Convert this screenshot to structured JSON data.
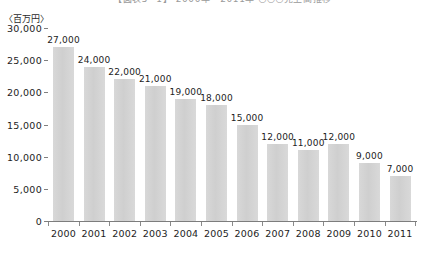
{
  "title_strip": {
    "text": "【図表5−1】 2000年〜2011年 ○○○売上高推移"
  },
  "axis": {
    "unit_label": "〈百万円〉",
    "y_ticks": [
      "30,000",
      "25,000",
      "20,000",
      "15,000",
      "10,000",
      "5,000",
      "0"
    ]
  },
  "chart_data": {
    "type": "bar",
    "title": "",
    "xlabel": "",
    "ylabel": "〈百万円〉",
    "categories": [
      "2000",
      "2001",
      "2002",
      "2003",
      "2004",
      "2005",
      "2006",
      "2007",
      "2008",
      "2009",
      "2010",
      "2011"
    ],
    "values": [
      27000,
      24000,
      22000,
      21000,
      19000,
      18000,
      15000,
      12000,
      11000,
      12000,
      9000,
      7000
    ],
    "value_labels": [
      "27,000",
      "24,000",
      "22,000",
      "21,000",
      "19,000",
      "18,000",
      "15,000",
      "12,000",
      "11,000",
      "12,000",
      "9,000",
      "7,000"
    ],
    "ylim": [
      0,
      30000
    ],
    "ytick_values": [
      30000,
      25000,
      20000,
      15000,
      10000,
      5000,
      0
    ],
    "grid": false,
    "legend": "none",
    "bar_color": "#d4d4d4",
    "axis_color": "#7d7d7d",
    "text_color": "#1d1d1d"
  }
}
